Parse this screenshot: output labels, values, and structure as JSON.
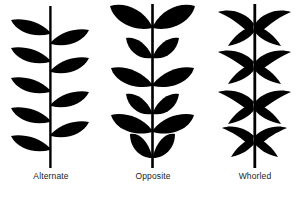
{
  "figure": {
    "background_color": "#ffffff",
    "silhouette_color": "#000000",
    "label_color": "#222222"
  },
  "patterns": [
    {
      "id": "alternate",
      "label": "Alternate",
      "description": "Single leaves attached at staggered heights, alternating sides of the stem",
      "leaf_shape": "lanceolate",
      "leaves_per_node": 1,
      "left_leaf_count": 5,
      "right_leaf_count": 4,
      "total_leaves": 9
    },
    {
      "id": "opposite",
      "label": "Opposite",
      "description": "Leaves attached in pairs directly across from each other at the same node",
      "leaf_shape": "ovate",
      "leaves_per_node": 2,
      "node_count": 6,
      "total_leaves": 12
    },
    {
      "id": "whorled",
      "label": "Whorled",
      "description": "Three or more narrow leaves radiating from a single node around the stem",
      "leaf_shape": "narrow-falcate",
      "leaves_per_node": 4,
      "node_count": 4,
      "total_leaves": 16
    }
  ]
}
